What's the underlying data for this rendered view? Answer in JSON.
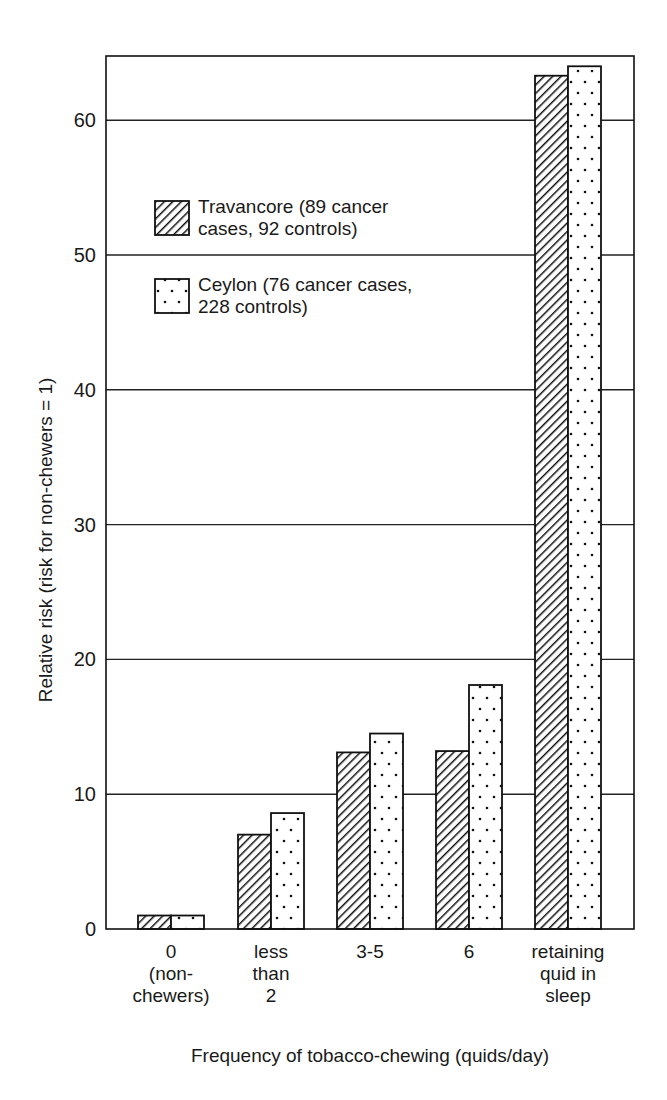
{
  "chart_data": {
    "type": "bar",
    "title": "",
    "xlabel": "Frequency of tobacco-chewing (quids/day)",
    "ylabel": "Relative risk (risk for non-chewers = 1)",
    "ylim": [
      0,
      65
    ],
    "yticks": [
      0,
      10,
      20,
      30,
      40,
      50,
      60
    ],
    "grid": "horizontal",
    "legend_position": "upper-left inside",
    "categories": [
      [
        "0",
        "(non-",
        "chewers)"
      ],
      [
        "less",
        "than",
        "2"
      ],
      [
        "3-5"
      ],
      [
        "6"
      ],
      [
        "retaining",
        "quid in",
        "sleep"
      ]
    ],
    "category_labels": [
      "0 (non-chewers)",
      "less than 2",
      "3-5",
      "6",
      "retaining quid in sleep"
    ],
    "series": [
      {
        "name": "Travancore (89 cancer cases, 92 controls)",
        "legend_lines": [
          "Travancore (89 cancer",
          "cases, 92 controls)"
        ],
        "pattern": "diagonal-hatch",
        "values": [
          1.0,
          7.0,
          13.1,
          13.2,
          63.3
        ]
      },
      {
        "name": "Ceylon (76 cancer cases, 228 controls)",
        "legend_lines": [
          "Ceylon (76 cancer cases,",
          "228 controls)"
        ],
        "pattern": "dotted",
        "values": [
          1.0,
          8.6,
          14.5,
          18.1,
          64.0
        ]
      }
    ]
  }
}
